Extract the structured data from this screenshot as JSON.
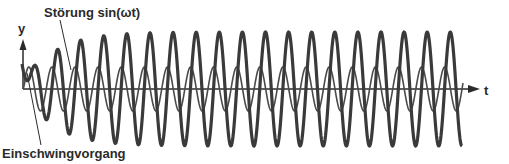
{
  "labels": {
    "disturbance": "Störung sin(ωt)",
    "transient": "Einschwingvorgang",
    "y_axis": "y",
    "t_axis": "t"
  },
  "colors": {
    "response": "#3a3a3a",
    "disturbance": "#4a4a4a",
    "axis": "#2a2a2a"
  },
  "chart_data": {
    "type": "line",
    "title": "",
    "xlabel": "t",
    "ylabel": "y",
    "grid": false,
    "legend": "none",
    "annotations": [
      "Störung sin(ωt)",
      "Einschwingvorgang"
    ],
    "origin_px": [
      23,
      89
    ],
    "x_end_px": 462,
    "series": [
      {
        "name": "Störung sin(ωt)",
        "style": "thin",
        "amplitude_px": 22,
        "period_px": 23.1,
        "first_peak_px": 75.1
      },
      {
        "name": "Antwort y(t) mit Einschwingvorgang",
        "style": "thick",
        "steady_amplitude_px": 57,
        "envelope_tau_px": 30,
        "period_px": 23.1,
        "first_peak_px": 80.7,
        "transient_start_px": [
          22,
          64
        ],
        "transient_end_px": [
          38,
          89
        ]
      }
    ]
  }
}
